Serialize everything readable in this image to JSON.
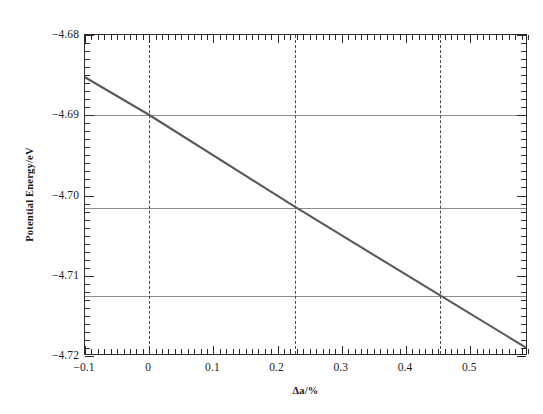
{
  "chart_data": {
    "type": "line",
    "title": "",
    "xlabel": "Δa/%",
    "ylabel": "Potential Energy/eV",
    "xlim": [
      -0.1,
      0.59
    ],
    "ylim": [
      -4.72,
      -4.68
    ],
    "x_ticks": [
      -0.1,
      0.0,
      0.1,
      0.2,
      0.3,
      0.4,
      0.5
    ],
    "x_tick_labels": [
      "-0.1",
      "0",
      "0.1",
      "0.2",
      "0.3",
      "0.4",
      "0.5"
    ],
    "y_ticks": [
      -4.72,
      -4.71,
      -4.7,
      -4.69,
      -4.68
    ],
    "y_tick_labels": [
      "-4.72",
      "-4.71",
      "-4.70",
      "-4.69",
      "-4.68"
    ],
    "x_minor_ticks_per_interval": 10,
    "y_minor_ticks_per_interval": 10,
    "grid": {
      "horizontal": true,
      "vertical_dashed": true,
      "horizontal_values": [
        -4.69,
        -4.7015,
        -4.7125
      ],
      "vertical_values": [
        0.0,
        0.2275,
        0.4525
      ],
      "grid_color": "#8c8c8c",
      "dash_color": "#4a4a4a"
    },
    "series": [
      {
        "name": "Potential Energy",
        "line_color": "#5a5a5a",
        "line_width": 2.1,
        "style": "solid",
        "x": [
          -0.1,
          0.0,
          0.2275,
          0.4525,
          0.59
        ],
        "y": [
          -4.6853,
          -4.69,
          -4.7015,
          -4.7125,
          -4.7192
        ]
      }
    ],
    "annotations": []
  },
  "axes": {
    "y_title": "Potential Energy/eV",
    "x_title": "Δa/%"
  }
}
